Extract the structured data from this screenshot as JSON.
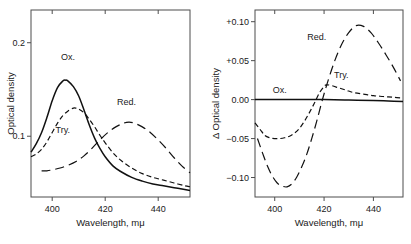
{
  "figure": {
    "background": "#ffffff",
    "ink_color": "#111111",
    "axis_color": "#4d4d4d"
  },
  "chart_data": [
    {
      "type": "line",
      "panel": "left",
      "title": "",
      "xlabel": "Wavelength, mμ",
      "ylabel": "Optical density",
      "xlim": [
        392,
        452
      ],
      "ylim": [
        0.035,
        0.235
      ],
      "xticks": [
        400,
        420,
        440
      ],
      "xticklabels": [
        "400",
        "420",
        "440"
      ],
      "yticks": [
        0.1,
        0.2
      ],
      "yticklabels": [
        "0.1",
        "0.2"
      ],
      "grid": false,
      "legend": "inline-labels",
      "series": [
        {
          "name": "Ox.",
          "label": "Ox.",
          "style": "solid",
          "label_x": 406,
          "label_y": 0.182,
          "x": [
            392,
            394,
            396,
            398,
            400,
            402,
            404,
            405,
            406,
            408,
            410,
            412,
            414,
            416,
            418,
            420,
            423,
            426,
            430,
            434,
            438,
            442,
            446,
            450,
            452
          ],
          "y": [
            0.083,
            0.092,
            0.104,
            0.12,
            0.138,
            0.152,
            0.159,
            0.16,
            0.159,
            0.153,
            0.143,
            0.128,
            0.112,
            0.098,
            0.087,
            0.078,
            0.068,
            0.062,
            0.056,
            0.052,
            0.049,
            0.047,
            0.045,
            0.043,
            0.042
          ]
        },
        {
          "name": "Try.",
          "label": "Try.",
          "style": "dashed",
          "label_x": 404,
          "label_y": 0.103,
          "x": [
            392,
            394,
            396,
            398,
            400,
            402,
            404,
            406,
            408,
            409,
            410,
            412,
            414,
            416,
            418,
            420,
            423,
            426,
            430,
            434,
            438,
            442,
            446,
            450,
            452
          ],
          "y": [
            0.078,
            0.081,
            0.086,
            0.094,
            0.104,
            0.114,
            0.122,
            0.127,
            0.13,
            0.13,
            0.129,
            0.125,
            0.118,
            0.11,
            0.101,
            0.093,
            0.082,
            0.074,
            0.066,
            0.06,
            0.056,
            0.053,
            0.05,
            0.047,
            0.046
          ]
        },
        {
          "name": "Red.",
          "label": "Red.",
          "style": "longdash",
          "label_x": 428,
          "label_y": 0.133,
          "x": [
            396,
            398,
            400,
            403,
            406,
            409,
            412,
            415,
            418,
            421,
            424,
            427,
            429,
            431,
            434,
            437,
            440,
            443,
            446,
            449,
            452
          ],
          "y": [
            0.063,
            0.063,
            0.064,
            0.066,
            0.069,
            0.073,
            0.079,
            0.087,
            0.096,
            0.104,
            0.11,
            0.114,
            0.115,
            0.114,
            0.11,
            0.104,
            0.096,
            0.087,
            0.077,
            0.068,
            0.061
          ]
        }
      ]
    },
    {
      "type": "line",
      "panel": "right",
      "title": "",
      "xlabel": "Wavelength, mμ",
      "ylabel": "Δ Optical density",
      "xlim": [
        392,
        452
      ],
      "ylim": [
        -0.125,
        0.115
      ],
      "xticks": [
        400,
        420,
        440
      ],
      "xticklabels": [
        "400",
        "420",
        "440"
      ],
      "yticks": [
        0.1,
        0.05,
        0.0,
        -0.05,
        -0.1
      ],
      "yticklabels": [
        "+0.10",
        "+0.05",
        "0.00",
        "−0.05",
        "−0.10"
      ],
      "grid": false,
      "legend": "inline-labels",
      "series": [
        {
          "name": "Ox.",
          "label": "Ox.",
          "style": "solid",
          "label_x": 402,
          "label_y": 0.009,
          "x": [
            392,
            400,
            410,
            420,
            430,
            440,
            446,
            452
          ],
          "y": [
            0.0,
            0.0,
            0.0,
            0.0,
            -0.0005,
            -0.0012,
            -0.0018,
            -0.0025
          ]
        },
        {
          "name": "Try.",
          "label": "Try.",
          "style": "dashed",
          "label_x": 427,
          "label_y": 0.028,
          "x": [
            392,
            394,
            396,
            398,
            400,
            402,
            404,
            406,
            408,
            410,
            412,
            414,
            416,
            418,
            420,
            421,
            423,
            426,
            429,
            432,
            436,
            440,
            444,
            448,
            452
          ],
          "y": [
            -0.03,
            -0.038,
            -0.046,
            -0.049,
            -0.05,
            -0.05,
            -0.049,
            -0.047,
            -0.043,
            -0.037,
            -0.028,
            -0.017,
            -0.005,
            0.008,
            0.017,
            0.019,
            0.018,
            0.015,
            0.012,
            0.009,
            0.007,
            0.005,
            0.004,
            0.003,
            0.002
          ]
        },
        {
          "name": "Red.",
          "label": "Red.",
          "style": "longdash",
          "label_x": 417,
          "label_y": 0.077,
          "x": [
            393,
            395,
            397,
            399,
            401,
            403,
            405,
            407,
            409,
            411,
            413,
            415,
            417,
            419,
            421,
            424,
            427,
            430,
            433,
            436,
            439,
            442,
            445,
            448,
            451
          ],
          "y": [
            -0.05,
            -0.068,
            -0.085,
            -0.098,
            -0.107,
            -0.111,
            -0.112,
            -0.108,
            -0.099,
            -0.086,
            -0.07,
            -0.05,
            -0.028,
            -0.004,
            0.018,
            0.047,
            0.07,
            0.086,
            0.095,
            0.094,
            0.086,
            0.073,
            0.058,
            0.042,
            0.024
          ]
        }
      ]
    }
  ]
}
